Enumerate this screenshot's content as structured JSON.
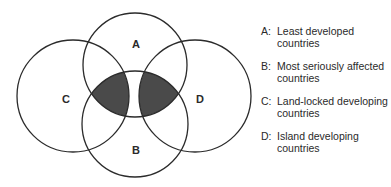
{
  "diagram": {
    "type": "venn",
    "sets": [
      {
        "id": "A",
        "label": "A"
      },
      {
        "id": "B",
        "label": "B"
      },
      {
        "id": "C",
        "label": "C"
      },
      {
        "id": "D",
        "label": "D"
      }
    ],
    "shaded_regions": [
      "A∩B∩C",
      "A∩B∩D"
    ],
    "shade_color": "#4a4a4a"
  },
  "legend": [
    {
      "key": "A:",
      "text": "Least developed countries"
    },
    {
      "key": "B:",
      "text": "Most seriously affected countries"
    },
    {
      "key": "C:",
      "text": "Land-locked developing countries"
    },
    {
      "key": "D:",
      "text": "Island developing countries"
    }
  ]
}
